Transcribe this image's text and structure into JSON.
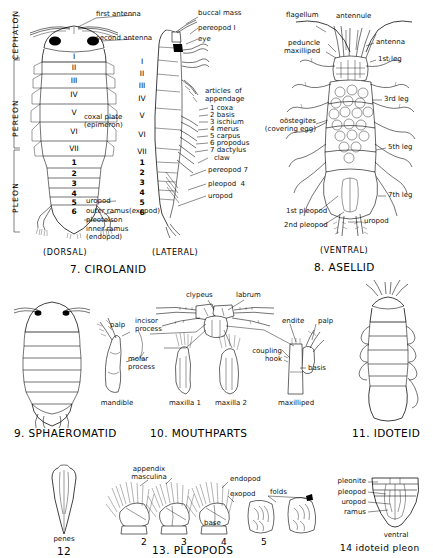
{
  "plate": {
    "title": "Isopod anatomy plate",
    "body_regions": [
      "CEPHALON",
      "PEREON",
      "PLEON"
    ]
  },
  "fig7": {
    "caption": "7. CIROLANID",
    "views": {
      "dorsal": "(DORSAL)",
      "lateral": "(LATERAL)"
    },
    "pereon_segments": [
      "I",
      "II",
      "III",
      "IV",
      "V",
      "VI",
      "VII"
    ],
    "pleon_segments": [
      "1",
      "2",
      "3",
      "4",
      "5",
      "6"
    ],
    "labels": {
      "first_antenna": "first antenna",
      "second_antenna": "second antenna",
      "coxal_plate": "coxal plate\n(epimeron)",
      "uropod": "uropod",
      "outer_ramus": "outer ramus(exopod)",
      "pleotelson": "pleotelson",
      "inner_ramus": "inner ramus\n(endopod)",
      "buccal_mass": "buccal mass",
      "pereopod_1": "pereopod I",
      "eye": "eye",
      "articles_heading": "articles  of\nappendage",
      "pereopod_7": "pereopod 7",
      "pleopod_4": "pleopod  4",
      "uropod_lateral": "uropod"
    },
    "articles": [
      "1 coxa",
      "2 basis",
      "3 ischium",
      "4 merus",
      "5 carpus",
      "6 propodus",
      "7 dactylus",
      "claw"
    ]
  },
  "fig8": {
    "caption": "8. ASELLID",
    "view": "(VENTRAL)",
    "labels": {
      "flagellum": "flagellum",
      "antennule": "antennule",
      "antenna": "antenna",
      "peduncle": "peduncle",
      "maxilliped": "maxilliped",
      "leg1": "1st leg",
      "leg3": "3rd leg",
      "leg5": "5th leg",
      "leg7": "7th leg",
      "oostegites": "oöstegites\n(covering egg)",
      "pleopod1": "1st pleopod",
      "pleopod2": "2nd pleopod",
      "uropod": "uropod"
    }
  },
  "fig9": {
    "caption": "9. SPHAEROMATID"
  },
  "fig10": {
    "caption": "10. MOUTHPARTS",
    "labels": {
      "clypeus": "clypeus",
      "labrum": "labrum",
      "palp_left": "palp",
      "incisor_process": "incisor\nprocess",
      "molar_process": "molar\nprocess",
      "endite": "endite",
      "palp_right": "palp",
      "coupling_hook": "coupling\nhook",
      "basis": "basis"
    },
    "parts": [
      "mandible",
      "maxilla 1",
      "maxilla 2",
      "maxilliped"
    ]
  },
  "fig11": {
    "caption": "11. IDOTEID"
  },
  "fig12": {
    "caption": "12",
    "label": "penes"
  },
  "fig13": {
    "caption": "13. PLEOPODS",
    "numbers": [
      "2",
      "3",
      "4",
      "5"
    ],
    "labels": {
      "appendix_masculina": "appendix\nmasculina",
      "endopod": "endopod",
      "exopod": "exopod",
      "folds": "folds",
      "base": "base"
    }
  },
  "fig14": {
    "caption": "14  idoteid pleon",
    "view": "ventral",
    "labels": {
      "pleonite": "pleonite",
      "pleopod": "pleopod",
      "uropod": "uropod",
      "ramus": "ramus"
    }
  }
}
